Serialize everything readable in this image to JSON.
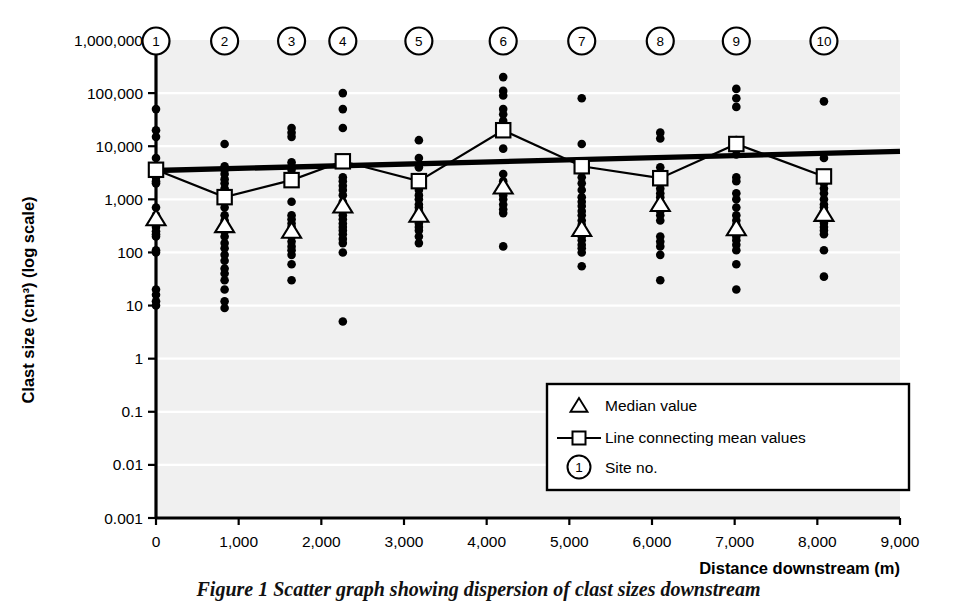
{
  "figure": {
    "caption": "Figure 1 Scatter graph showing dispersion of clast sizes downstream"
  },
  "legend": {
    "position": "inside-bottom-right",
    "items": [
      {
        "marker": "triangle-outline-marker",
        "label": "Median value"
      },
      {
        "marker": "line-square-marker",
        "label": "Line connecting mean values"
      },
      {
        "marker": "circled-number-marker",
        "label": "Site no.",
        "symbol": "1"
      }
    ]
  },
  "site_markers": {
    "labels": [
      "1",
      "2",
      "3",
      "4",
      "5",
      "6",
      "7",
      "8",
      "9",
      "10"
    ]
  },
  "colors": {
    "plot_background": "#f0f0f0",
    "gridline": "#ffffff",
    "axis": "#000000",
    "marker": "#000000",
    "trendline": "#000000"
  },
  "chart_data": {
    "type": "scatter",
    "title": "",
    "xlabel": "Distance downstream (m)",
    "ylabel": "Clast size (cm³) (log scale)",
    "yscale": "log",
    "ylim": [
      0.001,
      1000000
    ],
    "xlim": [
      0,
      9000
    ],
    "ytick_labels": [
      "1,000,000",
      "100,000",
      "10,000",
      "1,000",
      "100",
      "10",
      "1",
      "0.1",
      "0.01",
      "0.001"
    ],
    "ytick_values": [
      1000000,
      100000,
      10000,
      1000,
      100,
      10,
      1,
      0.1,
      0.01,
      0.001
    ],
    "xtick_labels": [
      "0",
      "1,000",
      "2,000",
      "3,000",
      "4,000",
      "5,000",
      "6,000",
      "7,000",
      "8,000",
      "9,000"
    ],
    "xtick_values": [
      0,
      1000,
      2000,
      3000,
      4000,
      5000,
      6000,
      7000,
      8000,
      9000
    ],
    "grid": "horizontal",
    "legend_position": "inside-bottom-right",
    "sites": [
      {
        "site": "1",
        "x": 0,
        "mean": 3600,
        "median": 430,
        "clast_sizes": [
          50000,
          20000,
          15000,
          6000,
          4000,
          3200,
          2600,
          2200,
          2000,
          700,
          500,
          430,
          350,
          300,
          250,
          220,
          200,
          110,
          100,
          20,
          16,
          12,
          10
        ]
      },
      {
        "site": "2",
        "x": 830,
        "mean": 1100,
        "median": 320,
        "clast_sizes": [
          11000,
          4200,
          3600,
          3000,
          2400,
          2000,
          1600,
          900,
          700,
          500,
          400,
          330,
          300,
          250,
          200,
          150,
          120,
          90,
          70,
          50,
          40,
          30,
          20,
          12,
          9
        ]
      },
      {
        "site": "3",
        "x": 1640,
        "mean": 2300,
        "median": 250,
        "clast_sizes": [
          22000,
          18000,
          15000,
          5000,
          4200,
          3600,
          3000,
          900,
          500,
          420,
          350,
          300,
          260,
          230,
          200,
          160,
          130,
          110,
          90,
          60,
          30
        ]
      },
      {
        "site": "4",
        "x": 2260,
        "mean": 5200,
        "median": 750,
        "clast_sizes": [
          100000,
          50000,
          22000,
          2600,
          2200,
          1800,
          1500,
          1200,
          900,
          750,
          600,
          500,
          420,
          350,
          300,
          260,
          220,
          180,
          150,
          100,
          5
        ]
      },
      {
        "site": "5",
        "x": 3180,
        "mean": 2200,
        "median": 500,
        "clast_sizes": [
          13000,
          6000,
          4000,
          2000,
          1500,
          1200,
          1000,
          800,
          700,
          600,
          520,
          450,
          400,
          350,
          300,
          260,
          200,
          150
        ]
      },
      {
        "site": "6",
        "x": 4200,
        "mean": 20000,
        "median": 1700,
        "clast_sizes": [
          200000,
          110000,
          90000,
          50000,
          40000,
          30000,
          22000,
          9000,
          3000,
          2200,
          1800,
          1500,
          1200,
          1000,
          800,
          650,
          550,
          130
        ]
      },
      {
        "site": "7",
        "x": 5150,
        "mean": 4200,
        "median": 270,
        "clast_sizes": [
          80000,
          11000,
          3600,
          2600,
          2000,
          1500,
          1100,
          900,
          750,
          600,
          500,
          400,
          330,
          280,
          240,
          200,
          170,
          140,
          120,
          100,
          55
        ]
      },
      {
        "site": "8",
        "x": 6100,
        "mean": 2500,
        "median": 800,
        "clast_sizes": [
          18000,
          14000,
          4000,
          2600,
          2000,
          1600,
          1300,
          1100,
          900,
          800,
          700,
          600,
          500,
          400,
          200,
          160,
          130,
          90,
          30
        ]
      },
      {
        "site": "9",
        "x": 7020,
        "mean": 11000,
        "median": 280,
        "clast_sizes": [
          120000,
          80000,
          55000,
          13000,
          7000,
          2600,
          2200,
          1300,
          1000,
          700,
          500,
          400,
          330,
          280,
          240,
          200,
          170,
          140,
          110,
          60,
          20
        ]
      },
      {
        "site": "10",
        "x": 8080,
        "mean": 2700,
        "median": 520,
        "clast_sizes": [
          70000,
          6000,
          2700,
          2000,
          1600,
          1300,
          1000,
          800,
          700,
          600,
          520,
          430,
          360,
          300,
          260,
          220,
          110,
          35
        ]
      }
    ],
    "trendline": {
      "name": "best-fit trend line",
      "x_start": 0,
      "y_start": 3500,
      "x_end": 9000,
      "y_end": 8000
    },
    "mean_line": {
      "name": "Line connecting mean values",
      "x": [
        0,
        830,
        1640,
        2260,
        3180,
        4200,
        5150,
        6100,
        7020,
        8080
      ],
      "values": [
        3600,
        1100,
        2300,
        5200,
        2200,
        20000,
        4200,
        2500,
        11000,
        2700
      ]
    },
    "median_series": {
      "name": "Median value",
      "x": [
        0,
        830,
        1640,
        2260,
        3180,
        4200,
        5150,
        6100,
        7020,
        8080
      ],
      "values": [
        430,
        320,
        250,
        750,
        500,
        1700,
        270,
        800,
        280,
        520
      ]
    }
  }
}
